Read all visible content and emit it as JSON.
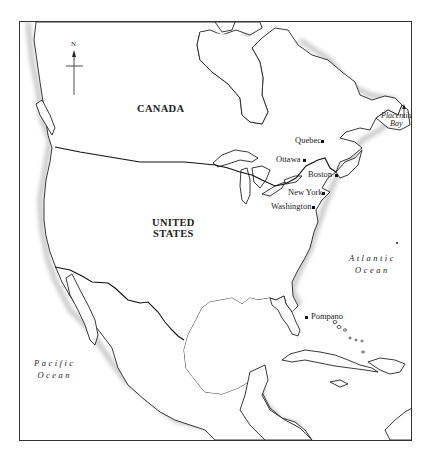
{
  "map": {
    "compass": {
      "label": "N"
    },
    "countries": [
      {
        "name": "CANADA"
      },
      {
        "name_line1": "UNITED",
        "name_line2": "STATES"
      }
    ],
    "cities": [
      {
        "name": "Quebec"
      },
      {
        "name": "Ottawa"
      },
      {
        "name": "Boston"
      },
      {
        "name": "New York"
      },
      {
        "name": "Washington"
      },
      {
        "name": "Pompano"
      }
    ],
    "bay": {
      "line1": "Placentia",
      "line2": "Bay"
    },
    "oceans": [
      {
        "line1": "Atlantic",
        "line2": "Ocean"
      },
      {
        "line1": "Pacific",
        "line2": "Ocean"
      }
    ],
    "colors": {
      "land": "#ffffff",
      "outline": "#222222",
      "hatch": "#9a9a9a",
      "frame": "#333333"
    }
  }
}
